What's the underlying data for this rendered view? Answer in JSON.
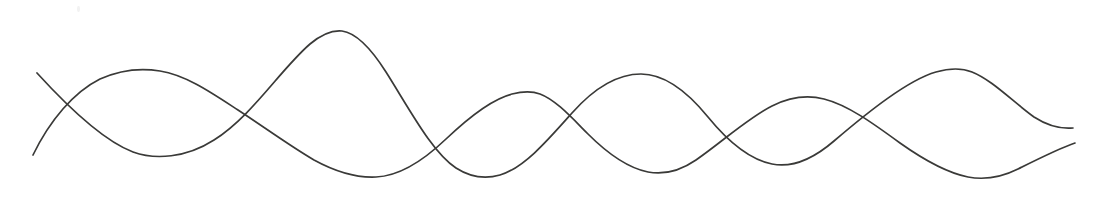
{
  "figure": {
    "width": 1109,
    "height": 201,
    "background_color": "#ffffff",
    "stroke_color": "#3a3a38",
    "stroke_width": 1.7,
    "artifact": {
      "name": "faint-speck",
      "x": 77,
      "y": 6,
      "color": "#f2f2f2"
    }
  },
  "chart_data": {
    "type": "line",
    "subtitle": "",
    "xlabel": "",
    "ylabel": "",
    "xlim": [
      0,
      1109
    ],
    "ylim": [
      201,
      0
    ],
    "grid": false,
    "legend": "none",
    "axes_visible": false,
    "tick_labels_x": [],
    "tick_labels_y": [],
    "note": "Coordinates are in screen pixels; y increases downward. Curve A is the longer-wavelength wave beginning high-left; Curve B is the shorter-wavelength wave beginning low-left.",
    "series": [
      {
        "name": "Curve A (long wavelength)",
        "color": "#3a3a38",
        "start_point": [
          37,
          73
        ],
        "end_point": [
          1073,
          128
        ],
        "extrema": [
          {
            "kind": "start",
            "x": 37,
            "y": 73
          },
          {
            "kind": "trough",
            "x": 165,
            "y": 158
          },
          {
            "kind": "peak",
            "x": 340,
            "y": 31
          },
          {
            "kind": "trough",
            "x": 497,
            "y": 175
          },
          {
            "kind": "peak",
            "x": 640,
            "y": 74
          },
          {
            "kind": "trough",
            "x": 790,
            "y": 165
          },
          {
            "kind": "peak",
            "x": 965,
            "y": 70
          },
          {
            "kind": "end",
            "x": 1073,
            "y": 128
          }
        ],
        "path": "M 37 73 C 68 107 104 141 133 152 C 155 160 186 158 214 140 C 252 116 280 70 310 44 C 322 34 332 30 342 31 C 357 33 372 50 386 72 C 410 110 432 152 456 168 C 470 177 486 179 500 175 C 524 168 548 140 572 113 C 596 86 620 74 641 74 C 664 74 686 90 708 117 C 730 144 752 160 772 164 C 792 168 812 160 834 141 C 868 112 908 80 936 72 C 950 68 962 68 972 72 C 992 80 1012 101 1034 117 C 1048 126 1062 129 1073 128"
      },
      {
        "name": "Curve B (short wavelength)",
        "color": "#3a3a38",
        "start_point": [
          33,
          155
        ],
        "end_point": [
          1075,
          143
        ],
        "extrema": [
          {
            "kind": "start",
            "x": 33,
            "y": 155
          },
          {
            "kind": "peak",
            "x": 158,
            "y": 71
          },
          {
            "kind": "trough",
            "x": 375,
            "y": 177
          },
          {
            "kind": "peak",
            "x": 535,
            "y": 93
          },
          {
            "kind": "trough",
            "x": 670,
            "y": 172
          },
          {
            "kind": "peak",
            "x": 820,
            "y": 99
          },
          {
            "kind": "trough",
            "x": 990,
            "y": 178
          },
          {
            "kind": "end",
            "x": 1075,
            "y": 143
          }
        ],
        "path": "M 33 155 C 50 120 74 92 100 79 C 120 70 142 68 160 71 C 186 75 212 93 238 110 C 264 127 290 146 314 160 C 336 172 356 178 376 177 C 400 176 424 160 446 139 C 468 118 492 99 512 94 C 524 91 532 91 540 94 C 556 100 572 118 588 134 C 606 152 628 168 648 172 C 664 175 680 171 696 160 C 722 142 748 118 772 106 C 790 97 808 95 824 99 C 848 105 874 124 900 143 C 924 160 948 173 968 177 C 984 180 1000 178 1018 169 C 1040 158 1060 148 1075 143"
      }
    ]
  }
}
